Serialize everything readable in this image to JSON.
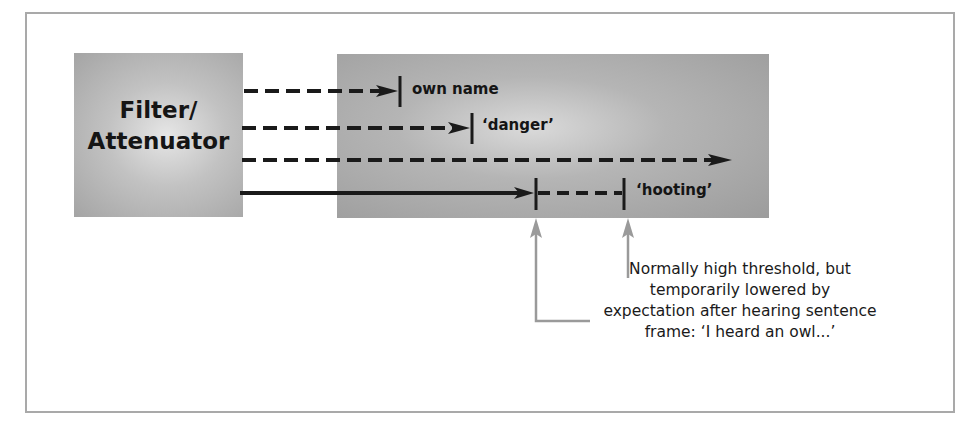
{
  "diagram": {
    "filter_box": {
      "line1": "Filter/",
      "line2": "Attenuator"
    },
    "labels": {
      "own_name": "own name",
      "danger": "‘danger’",
      "hooting": "‘hooting’"
    },
    "note": {
      "line1": "Normally high threshold, but",
      "line2": "temporarily lowered by",
      "line3": "expectation after hearing sentence",
      "line4": "frame: ‘I heard an owl...’"
    },
    "colors": {
      "frame_border": "#a9a9a9",
      "line": "#1a1a1a",
      "pointer_arrow": "#9a9a9a"
    }
  }
}
